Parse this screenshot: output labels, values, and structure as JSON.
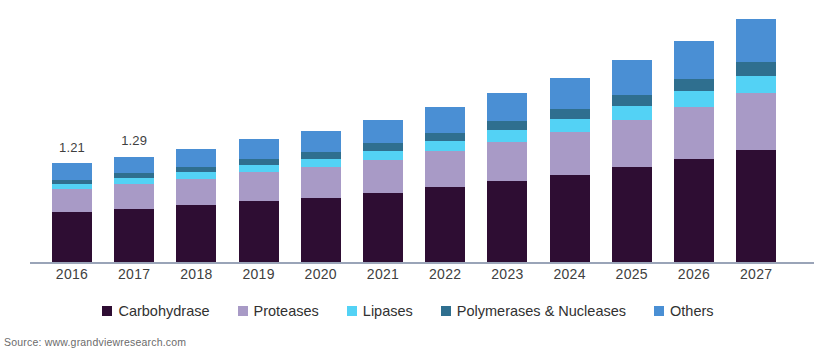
{
  "source": {
    "text": "Source: www.grandviewresearch.com"
  },
  "chart_data": {
    "type": "bar",
    "subtype": "stacked-column",
    "title": "",
    "subtitle": "",
    "xlabel": "",
    "ylabel": "",
    "grid": false,
    "legend_position": "bottom",
    "axis": {
      "x_axis_visible": true,
      "y_axis_visible": false,
      "y_tick_labels": []
    },
    "categories": [
      "2016",
      "2017",
      "2018",
      "2019",
      "2020",
      "2021",
      "2022",
      "2023",
      "2024",
      "2025",
      "2026",
      "2027"
    ],
    "series": [
      {
        "name": "Carbohydrase",
        "color": "#2e0d33",
        "values": [
          0.62,
          0.66,
          0.7,
          0.75,
          0.79,
          0.85,
          0.92,
          0.99,
          1.07,
          1.16,
          1.26,
          1.37
        ]
      },
      {
        "name": "Proteases",
        "color": "#a89ac6",
        "values": [
          0.28,
          0.3,
          0.32,
          0.35,
          0.37,
          0.4,
          0.44,
          0.48,
          0.52,
          0.57,
          0.63,
          0.69
        ]
      },
      {
        "name": "Lipases",
        "color": "#53d2f5",
        "values": [
          0.06,
          0.07,
          0.08,
          0.09,
          0.1,
          0.11,
          0.12,
          0.14,
          0.15,
          0.17,
          0.19,
          0.21
        ]
      },
      {
        "name": "Polymerases & Nucleases",
        "color": "#2f6f8f",
        "values": [
          0.05,
          0.06,
          0.06,
          0.07,
          0.08,
          0.09,
          0.1,
          0.11,
          0.12,
          0.14,
          0.15,
          0.17
        ]
      },
      {
        "name": "Others",
        "color": "#4a8fd4",
        "values": [
          0.2,
          0.2,
          0.22,
          0.24,
          0.26,
          0.28,
          0.31,
          0.34,
          0.38,
          0.42,
          0.46,
          0.51
        ]
      }
    ],
    "totals": [
      1.21,
      1.29,
      1.38,
      1.5,
      1.6,
      1.73,
      1.89,
      2.06,
      2.24,
      2.46,
      2.69,
      2.95
    ],
    "data_labels": [
      {
        "category": "2016",
        "value": "1.21"
      },
      {
        "category": "2017",
        "value": "1.29"
      }
    ],
    "ylim": [
      0,
      3.1
    ]
  },
  "legend": {
    "items": [
      {
        "label": "Carbohydrase",
        "color": "#2e0d33"
      },
      {
        "label": "Proteases",
        "color": "#a89ac6"
      },
      {
        "label": "Lipases",
        "color": "#53d2f5"
      },
      {
        "label": "Polymerases & Nucleases",
        "color": "#2f6f8f"
      },
      {
        "label": "Others",
        "color": "#4a8fd4"
      }
    ]
  }
}
